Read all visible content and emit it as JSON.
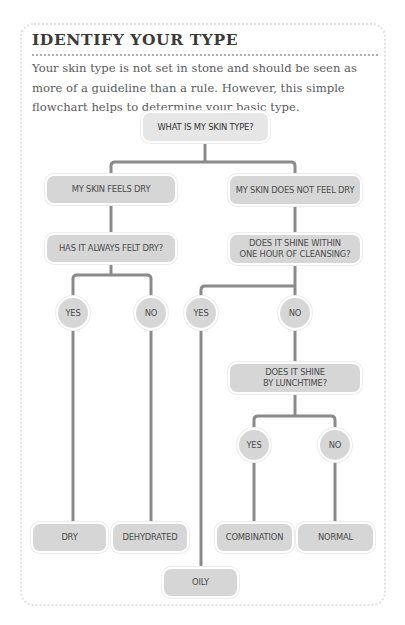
{
  "header": {
    "title": "IDENTIFY YOUR TYPE",
    "intro": "Your skin type is not set in stone and should be seen as more of a guideline than a rule. However, this simple flowchart helps to determine your basic type."
  },
  "flowchart": {
    "root": "WHAT IS MY SKIN TYPE?",
    "branch_dry": {
      "label": "MY SKIN FEELS DRY",
      "question": "HAS IT ALWAYS FELT DRY?",
      "yes": "YES",
      "no": "NO",
      "result_yes": "DRY",
      "result_no": "DEHYDRATED"
    },
    "branch_not_dry": {
      "label": "MY SKIN DOES NOT FEEL DRY",
      "question": "DOES IT SHINE WITHIN\nONE HOUR OF CLEANSING?",
      "yes": "YES",
      "no": "NO",
      "result_yes": "OILY",
      "followup": {
        "question": "DOES IT SHINE\nBY LUNCHTIME?",
        "yes": "YES",
        "no": "NO",
        "result_yes": "COMBINATION",
        "result_no": "NORMAL"
      }
    }
  },
  "colors": {
    "box_fill": "#d6d6d6",
    "connector": "#8a8a8a",
    "text": "#4a4a4a",
    "title": "#3a3a3a",
    "frame_border": "#e2e2e2"
  }
}
